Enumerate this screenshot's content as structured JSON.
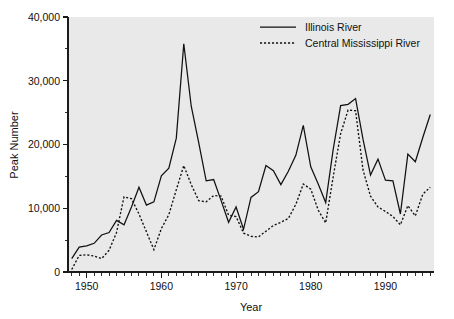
{
  "chart_data": {
    "type": "line",
    "title": "",
    "xlabel": "Year",
    "ylabel": "Peak Number",
    "xlim": [
      1947.5,
      1996.5
    ],
    "ylim": [
      0,
      40000
    ],
    "grid": false,
    "legend_position": "top-right",
    "y_ticks": [
      0,
      10000,
      20000,
      30000,
      40000
    ],
    "y_ticklabels": [
      "0",
      "10,000",
      "20,000",
      "30,000",
      "40,000"
    ],
    "x_ticks": [
      1950,
      1960,
      1970,
      1980,
      1990
    ],
    "x_ticklabels": [
      "1950",
      "1960",
      "1970",
      "1980",
      "1990"
    ],
    "x_minor_tick_interval": 1,
    "x": [
      1948,
      1949,
      1950,
      1951,
      1952,
      1953,
      1954,
      1955,
      1956,
      1957,
      1958,
      1959,
      1960,
      1961,
      1962,
      1963,
      1964,
      1965,
      1966,
      1967,
      1968,
      1969,
      1970,
      1971,
      1972,
      1973,
      1974,
      1975,
      1976,
      1977,
      1978,
      1979,
      1980,
      1981,
      1982,
      1983,
      1984,
      1985,
      1986,
      1987,
      1988,
      1989,
      1990,
      1991,
      1992,
      1993,
      1994,
      1995,
      1996
    ],
    "series": [
      {
        "name": "Illinois River",
        "style": "solid",
        "values": [
          2100,
          3900,
          4100,
          4500,
          5800,
          6200,
          8100,
          7400,
          10200,
          13300,
          10500,
          11000,
          15100,
          16300,
          21000,
          35800,
          26000,
          20300,
          14300,
          14500,
          11200,
          7800,
          10200,
          6700,
          11700,
          12600,
          16700,
          15900,
          13700,
          15800,
          18300,
          23000,
          16500,
          13800,
          10900,
          19200,
          26100,
          26300,
          27200,
          20800,
          15200,
          17700,
          14400,
          14300,
          9100,
          18500,
          17300,
          21100,
          24700
        ]
      },
      {
        "name": "Central Mississippi River",
        "style": "dotted",
        "values": [
          400,
          2600,
          2700,
          2500,
          2100,
          3400,
          6200,
          11800,
          11500,
          9100,
          6300,
          3500,
          6800,
          9000,
          12900,
          16700,
          13700,
          11200,
          11000,
          12000,
          11900,
          8900,
          8700,
          6100,
          5600,
          5500,
          6400,
          7300,
          7800,
          8400,
          10600,
          13800,
          13000,
          9700,
          7700,
          14900,
          21700,
          25400,
          25300,
          16000,
          11900,
          10200,
          9500,
          8700,
          7400,
          10400,
          8800,
          12200,
          13300
        ]
      }
    ]
  },
  "legend": {
    "entries": [
      {
        "label": "Illinois River",
        "style": "solid"
      },
      {
        "label": "Central Mississippi River",
        "style": "dotted"
      }
    ]
  },
  "colors": {
    "plot_background": "#e9e9e9",
    "page_background": "#ffffff",
    "line": "#111111",
    "text": "#111111"
  }
}
